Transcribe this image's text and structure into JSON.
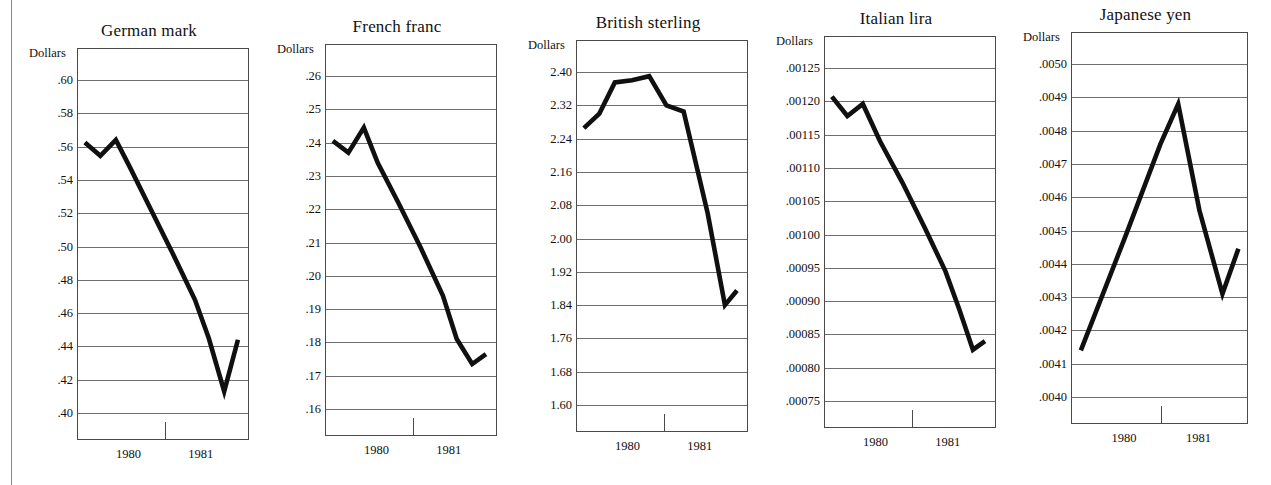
{
  "page": {
    "background_color": "#ffffff",
    "ink_color": "#101010",
    "rule_color": "#6e6e6e",
    "margin_rule": "vertical-page-margin-rule"
  },
  "axis_label": "Dollars",
  "x_tick_labels": [
    "1980",
    "1981"
  ],
  "footer_note": "",
  "chart_data": [
    {
      "type": "line",
      "title": "German mark",
      "ylabel": "Dollars",
      "xlabel": "",
      "grid": true,
      "legend": "none",
      "ylim": [
        0.4,
        0.6
      ],
      "ytick_labels": [
        ".60",
        ".58",
        ".56",
        ".54",
        ".52",
        ".50",
        ".48",
        ".46",
        ".44",
        ".42",
        ".40"
      ],
      "ytick_values": [
        0.6,
        0.58,
        0.56,
        0.54,
        0.52,
        0.5,
        0.48,
        0.46,
        0.44,
        0.42,
        0.4
      ],
      "xtick_labels": [
        "1980",
        "1981"
      ],
      "xtick_positions": [
        0.3,
        0.72
      ],
      "x": [
        0.04,
        0.13,
        0.22,
        0.3,
        0.42,
        0.55,
        0.68,
        0.76,
        0.85,
        0.93
      ],
      "values": [
        0.5625,
        0.5545,
        0.564,
        0.548,
        0.523,
        0.496,
        0.468,
        0.445,
        0.413,
        0.444
      ]
    },
    {
      "type": "line",
      "title": "French franc",
      "ylabel": "Dollars",
      "xlabel": "",
      "grid": true,
      "legend": "none",
      "ylim": [
        0.16,
        0.26
      ],
      "ytick_labels": [
        ".26",
        ".25",
        ".24",
        ".23",
        ".22",
        ".21",
        ".20",
        ".19",
        ".18",
        ".17",
        ".16"
      ],
      "ytick_values": [
        0.26,
        0.25,
        0.24,
        0.23,
        0.22,
        0.21,
        0.2,
        0.19,
        0.18,
        0.17,
        0.16
      ],
      "xtick_labels": [
        "1980",
        "1981"
      ],
      "xtick_positions": [
        0.3,
        0.72
      ],
      "x": [
        0.04,
        0.13,
        0.22,
        0.3,
        0.42,
        0.55,
        0.68,
        0.76,
        0.85,
        0.93
      ],
      "values": [
        0.2405,
        0.237,
        0.2445,
        0.234,
        0.222,
        0.2085,
        0.194,
        0.181,
        0.1735,
        0.1765
      ]
    },
    {
      "type": "line",
      "title": "British sterling",
      "ylabel": "Dollars",
      "xlabel": "",
      "grid": true,
      "legend": "none",
      "ylim": [
        1.6,
        2.4
      ],
      "ytick_labels": [
        "2.40",
        "2.32",
        "2.24",
        "2.16",
        "2.08",
        "2.00",
        "1.92",
        "1.84",
        "1.76",
        "1.68",
        "1.60"
      ],
      "ytick_values": [
        2.4,
        2.32,
        2.24,
        2.16,
        2.08,
        2.0,
        1.92,
        1.84,
        1.76,
        1.68,
        1.6
      ],
      "xtick_labels": [
        "1980",
        "1981"
      ],
      "xtick_positions": [
        0.3,
        0.72
      ],
      "x": [
        0.04,
        0.13,
        0.22,
        0.32,
        0.42,
        0.52,
        0.62,
        0.76,
        0.86,
        0.93
      ],
      "values": [
        2.265,
        2.3,
        2.375,
        2.38,
        2.39,
        2.32,
        2.305,
        2.06,
        1.84,
        1.875
      ]
    },
    {
      "type": "line",
      "title": "Italian lira",
      "ylabel": "Dollars",
      "xlabel": "",
      "grid": true,
      "legend": "none",
      "ylim": [
        0.00075,
        0.00125
      ],
      "ytick_labels": [
        ".00125",
        ".00120",
        ".00115",
        ".00110",
        ".00105",
        ".00100",
        ".00095",
        ".00090",
        ".00085",
        ".00080",
        ".00075"
      ],
      "ytick_values": [
        0.00125,
        0.0012,
        0.00115,
        0.0011,
        0.00105,
        0.001,
        0.00095,
        0.0009,
        0.00085,
        0.0008,
        0.00075
      ],
      "xtick_labels": [
        "1980",
        "1981"
      ],
      "xtick_positions": [
        0.3,
        0.72
      ],
      "x": [
        0.04,
        0.13,
        0.22,
        0.32,
        0.45,
        0.58,
        0.7,
        0.78,
        0.86,
        0.93
      ],
      "values": [
        0.001207,
        0.001178,
        0.001196,
        0.00114,
        0.001078,
        0.00101,
        0.000945,
        0.000888,
        0.000827,
        0.00084
      ]
    },
    {
      "type": "line",
      "title": "Japanese yen",
      "ylabel": "Dollars",
      "xlabel": "",
      "grid": true,
      "legend": "none",
      "ylim": [
        0.004,
        0.005
      ],
      "ytick_labels": [
        ".0050",
        ".0049",
        ".0048",
        ".0047",
        ".0046",
        ".0045",
        ".0044",
        ".0043",
        ".0042",
        ".0041",
        ".0040"
      ],
      "ytick_values": [
        0.005,
        0.0049,
        0.0048,
        0.0047,
        0.0046,
        0.0045,
        0.0044,
        0.0043,
        0.0042,
        0.0041,
        0.004
      ],
      "xtick_labels": [
        "1980",
        "1981"
      ],
      "xtick_positions": [
        0.3,
        0.72
      ],
      "x": [
        0.05,
        0.3,
        0.5,
        0.6,
        0.72,
        0.85,
        0.94
      ],
      "values": [
        0.00414,
        0.00448,
        0.00476,
        0.00488,
        0.00456,
        0.00431,
        0.004445
      ]
    }
  ],
  "layout": {
    "chart_left_offsets": [
      20,
      270,
      520,
      770,
      1020
    ],
    "plot_lefts": [
      77,
      325,
      576,
      824,
      1071
    ],
    "plot_widths": [
      172,
      172,
      172,
      172,
      177
    ],
    "plot_tops": [
      48,
      44,
      40,
      36,
      32
    ],
    "plot_heights": [
      392,
      392,
      392,
      392,
      392
    ],
    "grid_first_offsets": [
      31,
      31,
      31,
      31,
      31
    ],
    "grid_spacing": 33.3
  }
}
